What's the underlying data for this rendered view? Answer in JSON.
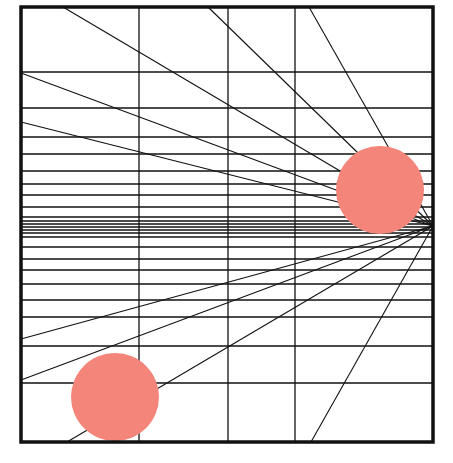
{
  "diagram": {
    "title": "",
    "background": "#ffffff",
    "line_color": "#111111",
    "frame": {
      "x": 21,
      "y": 7,
      "width": 412,
      "height": 435,
      "stroke_width": 3.5
    },
    "vertical_lines_x": [
      139,
      228,
      295
    ],
    "horizontal_lines_y": [
      72,
      108,
      137,
      154,
      171,
      184,
      195,
      207,
      217,
      221,
      224,
      227,
      230,
      233,
      237,
      247,
      259,
      270,
      284,
      300,
      317,
      346,
      383
    ],
    "vanishing_point": {
      "x": 433,
      "y": 226
    },
    "rays_from": [
      {
        "x": 63,
        "y": 7
      },
      {
        "x": 208,
        "y": 7
      },
      {
        "x": 309,
        "y": 7
      },
      {
        "x": 21,
        "y": 73
      },
      {
        "x": 21,
        "y": 122
      },
      {
        "x": 21,
        "y": 339
      },
      {
        "x": 21,
        "y": 380
      },
      {
        "x": 67,
        "y": 442
      },
      {
        "x": 311,
        "y": 442
      }
    ],
    "circles": [
      {
        "name": "circle-lower-left",
        "cx": 115,
        "cy": 397,
        "r": 44,
        "fill": "#F4857A"
      },
      {
        "name": "circle-right",
        "cx": 380,
        "cy": 190,
        "r": 44,
        "fill": "#F4857A"
      }
    ]
  }
}
